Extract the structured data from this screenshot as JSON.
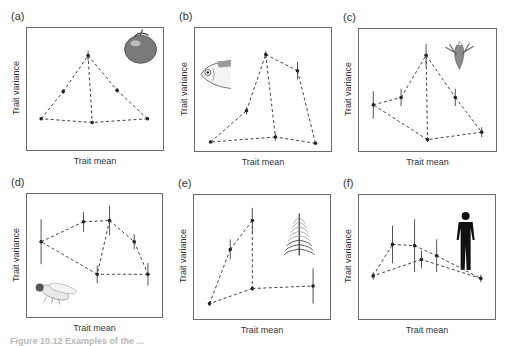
{
  "chart_data": [
    {
      "id": "a",
      "type": "scatter",
      "panel_label": "(a)",
      "xlabel": "Trait mean",
      "ylabel": "Trait variance",
      "icon": "tomato-icon",
      "xlim": [
        0,
        1
      ],
      "ylim": [
        0,
        1
      ],
      "points": [
        {
          "x": 0.11,
          "y": 0.26,
          "err": 0.0
        },
        {
          "x": 0.27,
          "y": 0.48,
          "err": 0.02
        },
        {
          "x": 0.45,
          "y": 0.77,
          "err": 0.04
        },
        {
          "x": 0.66,
          "y": 0.49,
          "err": 0.02
        },
        {
          "x": 0.88,
          "y": 0.26,
          "err": 0.0
        },
        {
          "x": 0.48,
          "y": 0.23,
          "err": 0.0
        }
      ],
      "edges": [
        [
          0,
          1
        ],
        [
          1,
          2
        ],
        [
          2,
          3
        ],
        [
          3,
          4
        ],
        [
          4,
          5
        ],
        [
          5,
          0
        ],
        [
          2,
          5
        ]
      ]
    },
    {
      "id": "b",
      "type": "scatter",
      "panel_label": "(b)",
      "xlabel": "Trait mean",
      "ylabel": "Trait variance",
      "icon": "fish-icon",
      "xlim": [
        0,
        1
      ],
      "ylim": [
        0,
        1
      ],
      "points": [
        {
          "x": 0.12,
          "y": 0.08,
          "err": 0.0
        },
        {
          "x": 0.38,
          "y": 0.33,
          "err": 0.03
        },
        {
          "x": 0.52,
          "y": 0.78,
          "err": 0.03
        },
        {
          "x": 0.75,
          "y": 0.65,
          "err": 0.07
        },
        {
          "x": 0.88,
          "y": 0.07,
          "err": 0.0
        },
        {
          "x": 0.59,
          "y": 0.12,
          "err": 0.03
        }
      ],
      "edges": [
        [
          0,
          1
        ],
        [
          1,
          2
        ],
        [
          2,
          3
        ],
        [
          3,
          4
        ],
        [
          4,
          5
        ],
        [
          5,
          0
        ],
        [
          2,
          5
        ]
      ]
    },
    {
      "id": "c",
      "type": "scatter",
      "panel_label": "(c)",
      "xlabel": "Trait mean",
      "ylabel": "Trait variance",
      "icon": "flower-icon",
      "xlim": [
        0,
        1
      ],
      "ylim": [
        0,
        1
      ],
      "points": [
        {
          "x": 0.11,
          "y": 0.38,
          "err": 0.11
        },
        {
          "x": 0.31,
          "y": 0.44,
          "err": 0.07
        },
        {
          "x": 0.49,
          "y": 0.78,
          "err": 0.09
        },
        {
          "x": 0.7,
          "y": 0.44,
          "err": 0.07
        },
        {
          "x": 0.89,
          "y": 0.16,
          "err": 0.04
        },
        {
          "x": 0.5,
          "y": 0.1,
          "err": 0.02
        }
      ],
      "edges": [
        [
          0,
          1
        ],
        [
          1,
          2
        ],
        [
          2,
          3
        ],
        [
          3,
          4
        ],
        [
          4,
          5
        ],
        [
          5,
          0
        ],
        [
          2,
          5
        ]
      ]
    },
    {
      "id": "d",
      "type": "scatter",
      "panel_label": "(d)",
      "xlabel": "Trait mean",
      "ylabel": "Trait variance",
      "icon": "fruit-fly-icon",
      "xlim": [
        0,
        1
      ],
      "ylim": [
        0,
        1
      ],
      "points": [
        {
          "x": 0.11,
          "y": 0.61,
          "err": 0.18
        },
        {
          "x": 0.42,
          "y": 0.77,
          "err": 0.08
        },
        {
          "x": 0.61,
          "y": 0.78,
          "err": 0.12
        },
        {
          "x": 0.79,
          "y": 0.61,
          "err": 0.06
        },
        {
          "x": 0.89,
          "y": 0.35,
          "err": 0.09
        },
        {
          "x": 0.52,
          "y": 0.35,
          "err": 0.07
        }
      ],
      "edges": [
        [
          0,
          1
        ],
        [
          1,
          2
        ],
        [
          2,
          3
        ],
        [
          3,
          4
        ],
        [
          4,
          5
        ],
        [
          5,
          0
        ],
        [
          2,
          5
        ]
      ]
    },
    {
      "id": "e",
      "type": "scatter",
      "panel_label": "(e)",
      "xlabel": "Trait mean",
      "ylabel": "Trait variance",
      "icon": "plant-sprig-icon",
      "xlim": [
        0,
        1
      ],
      "ylim": [
        0,
        1
      ],
      "points": [
        {
          "x": 0.12,
          "y": 0.13,
          "err": 0.02
        },
        {
          "x": 0.27,
          "y": 0.56,
          "err": 0.08
        },
        {
          "x": 0.43,
          "y": 0.79,
          "err": 0.1
        },
        {
          "x": 0.43,
          "y": 0.25,
          "err": 0.02
        },
        {
          "x": 0.87,
          "y": 0.27,
          "err": 0.14
        }
      ],
      "edges": [
        [
          0,
          1
        ],
        [
          1,
          2
        ],
        [
          2,
          3
        ],
        [
          3,
          4
        ],
        [
          3,
          0
        ]
      ]
    },
    {
      "id": "f",
      "type": "scatter",
      "panel_label": "(f)",
      "xlabel": "Trait mean",
      "ylabel": "Trait variance",
      "icon": "human-silhouette-icon",
      "xlim": [
        0,
        1
      ],
      "ylim": [
        0,
        1
      ],
      "points": [
        {
          "x": 0.11,
          "y": 0.35,
          "err": 0.03
        },
        {
          "x": 0.25,
          "y": 0.6,
          "err": 0.15
        },
        {
          "x": 0.41,
          "y": 0.59,
          "err": 0.21
        },
        {
          "x": 0.46,
          "y": 0.48,
          "err": 0.07
        },
        {
          "x": 0.57,
          "y": 0.51,
          "err": 0.13
        },
        {
          "x": 0.89,
          "y": 0.33,
          "err": 0.03
        }
      ],
      "edges": [
        [
          0,
          1
        ],
        [
          1,
          2
        ],
        [
          2,
          4
        ],
        [
          4,
          5
        ],
        [
          5,
          3
        ],
        [
          3,
          0
        ]
      ]
    }
  ],
  "caption": "Figure 10.12  Examples of the ..."
}
